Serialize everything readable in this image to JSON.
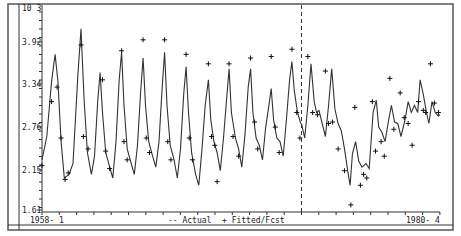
{
  "chart_data": {
    "type": "line",
    "title": "",
    "scale_label": "10 3",
    "xlabel": "",
    "ylabel": "",
    "x_start_label": "1958- 1",
    "x_end_label": "1980- 4",
    "yticks": [
      1.61,
      2.15,
      2.76,
      3.34,
      3.92
    ],
    "ytick_labels": [
      "1.61",
      "2.15",
      "2.76",
      "3.34",
      "3.92"
    ],
    "ylim": [
      1.61,
      4.2
    ],
    "legend": [
      {
        "symbol": "--",
        "label": "Actual"
      },
      {
        "symbol": "+",
        "label": "Fitted/Fcst"
      }
    ],
    "legend_position": "bottom",
    "grid": false,
    "forecast_divider_x_fraction": 0.652,
    "series": [
      {
        "name": "Actual",
        "style": "line",
        "points": [
          [
            0.0,
            2.3
          ],
          [
            0.012,
            2.62
          ],
          [
            0.024,
            3.38
          ],
          [
            0.033,
            3.75
          ],
          [
            0.04,
            3.38
          ],
          [
            0.048,
            2.55
          ],
          [
            0.056,
            2.05
          ],
          [
            0.068,
            2.1
          ],
          [
            0.078,
            2.25
          ],
          [
            0.09,
            3.45
          ],
          [
            0.098,
            4.1
          ],
          [
            0.106,
            3.1
          ],
          [
            0.114,
            2.4
          ],
          [
            0.124,
            2.1
          ],
          [
            0.132,
            2.35
          ],
          [
            0.14,
            3.1
          ],
          [
            0.146,
            3.5
          ],
          [
            0.152,
            2.95
          ],
          [
            0.16,
            2.4
          ],
          [
            0.17,
            2.2
          ],
          [
            0.178,
            2.05
          ],
          [
            0.186,
            2.55
          ],
          [
            0.194,
            3.4
          ],
          [
            0.2,
            3.78
          ],
          [
            0.206,
            3.05
          ],
          [
            0.214,
            2.45
          ],
          [
            0.224,
            2.25
          ],
          [
            0.232,
            2.1
          ],
          [
            0.24,
            2.5
          ],
          [
            0.248,
            3.25
          ],
          [
            0.254,
            3.7
          ],
          [
            0.26,
            3.05
          ],
          [
            0.268,
            2.55
          ],
          [
            0.278,
            2.35
          ],
          [
            0.286,
            2.2
          ],
          [
            0.294,
            2.55
          ],
          [
            0.302,
            3.3
          ],
          [
            0.308,
            3.78
          ],
          [
            0.314,
            3.05
          ],
          [
            0.322,
            2.5
          ],
          [
            0.332,
            2.3
          ],
          [
            0.34,
            2.05
          ],
          [
            0.348,
            2.45
          ],
          [
            0.356,
            3.2
          ],
          [
            0.362,
            3.58
          ],
          [
            0.368,
            2.95
          ],
          [
            0.376,
            2.4
          ],
          [
            0.386,
            2.1
          ],
          [
            0.394,
            1.95
          ],
          [
            0.402,
            2.45
          ],
          [
            0.41,
            3.05
          ],
          [
            0.418,
            3.4
          ],
          [
            0.424,
            2.85
          ],
          [
            0.432,
            2.55
          ],
          [
            0.44,
            2.4
          ],
          [
            0.448,
            2.15
          ],
          [
            0.456,
            2.6
          ],
          [
            0.464,
            3.15
          ],
          [
            0.47,
            3.55
          ],
          [
            0.476,
            2.95
          ],
          [
            0.486,
            2.6
          ],
          [
            0.494,
            2.45
          ],
          [
            0.502,
            2.2
          ],
          [
            0.51,
            2.65
          ],
          [
            0.518,
            3.3
          ],
          [
            0.524,
            3.55
          ],
          [
            0.53,
            2.95
          ],
          [
            0.538,
            2.6
          ],
          [
            0.546,
            2.5
          ],
          [
            0.554,
            2.3
          ],
          [
            0.562,
            2.75
          ],
          [
            0.57,
            3.05
          ],
          [
            0.576,
            3.28
          ],
          [
            0.582,
            2.85
          ],
          [
            0.59,
            2.6
          ],
          [
            0.598,
            2.55
          ],
          [
            0.606,
            2.35
          ],
          [
            0.614,
            2.85
          ],
          [
            0.622,
            3.4
          ],
          [
            0.628,
            3.65
          ],
          [
            0.634,
            3.25
          ],
          [
            0.642,
            2.95
          ],
          [
            0.65,
            2.8
          ],
          [
            0.656,
            2.6
          ],
          [
            0.664,
            2.95
          ],
          [
            0.672,
            3.38
          ],
          [
            0.678,
            3.6
          ],
          [
            0.684,
            3.2
          ],
          [
            0.692,
            2.85
          ],
          [
            0.7,
            2.75
          ],
          [
            0.708,
            2.55
          ],
          [
            0.716,
            2.9
          ],
          [
            0.724,
            3.3
          ],
          [
            0.73,
            3.55
          ],
          [
            0.736,
            3.15
          ],
          [
            0.744,
            2.85
          ],
          [
            0.752,
            2.7
          ],
          [
            0.76,
            2.45
          ],
          [
            0.768,
            2.75
          ],
          [
            0.776,
            3.0
          ],
          [
            0.782,
            3.25
          ],
          [
            0.788,
            2.9
          ],
          [
            0.796,
            2.65
          ],
          [
            0.804,
            2.5
          ],
          [
            0.812,
            2.3
          ],
          [
            0.82,
            2.55
          ],
          [
            0.826,
            2.85
          ],
          [
            0.834,
            2.55
          ],
          [
            0.842,
            2.2
          ],
          [
            0.85,
            2.05
          ],
          [
            0.856,
            1.85
          ],
          [
            0.862,
            2.15
          ],
          [
            0.87,
            2.5
          ],
          [
            0.878,
            2.2
          ],
          [
            0.886,
            2.1
          ],
          [
            0.896,
            2.15
          ],
          [
            0.904,
            2.05
          ]
        ]
      },
      {
        "name": "Fitted/Fcst",
        "style": "plus",
        "points": [
          [
            0.0,
            2.22
          ],
          [
            0.024,
            3.1
          ],
          [
            0.038,
            3.3
          ],
          [
            0.048,
            2.6
          ],
          [
            0.058,
            2.03
          ],
          [
            0.066,
            2.12
          ],
          [
            0.098,
            3.88
          ],
          [
            0.104,
            2.62
          ],
          [
            0.116,
            2.45
          ],
          [
            0.152,
            3.4
          ],
          [
            0.16,
            2.42
          ],
          [
            0.17,
            2.18
          ],
          [
            0.2,
            3.8
          ],
          [
            0.206,
            2.55
          ],
          [
            0.214,
            2.3
          ],
          [
            0.254,
            3.95
          ],
          [
            0.262,
            2.6
          ],
          [
            0.27,
            2.4
          ],
          [
            0.308,
            3.95
          ],
          [
            0.316,
            2.55
          ],
          [
            0.324,
            2.3
          ],
          [
            0.362,
            3.75
          ],
          [
            0.37,
            2.6
          ],
          [
            0.378,
            2.3
          ],
          [
            0.418,
            3.62
          ],
          [
            0.426,
            2.62
          ],
          [
            0.434,
            2.5
          ],
          [
            0.44,
            2.0
          ],
          [
            0.47,
            3.62
          ],
          [
            0.48,
            2.62
          ],
          [
            0.494,
            2.35
          ],
          [
            0.524,
            3.7
          ],
          [
            0.534,
            2.82
          ],
          [
            0.542,
            2.45
          ],
          [
            0.576,
            3.72
          ],
          [
            0.586,
            2.75
          ],
          [
            0.596,
            2.4
          ],
          [
            0.628,
            3.82
          ],
          [
            0.64,
            2.95
          ],
          [
            0.648,
            2.6
          ],
          [
            0.664,
            2.08
          ],
          [
            0.68,
            4.05
          ],
          [
            0.69,
            2.95
          ],
          [
            0.7,
            2.82
          ],
          [
            0.708,
            2.58
          ],
          [
            0.73,
            3.65
          ],
          [
            0.742,
            2.9
          ],
          [
            0.752,
            2.78
          ],
          [
            0.77,
            3.28
          ],
          [
            0.78,
            2.65
          ],
          [
            0.79,
            2.6
          ],
          [
            0.81,
            2.2
          ]
        ]
      }
    ],
    "forecast_series": {
      "actual_points": [
        [
          0.652,
          2.8
        ],
        [
          0.66,
          2.6
        ],
        [
          0.668,
          3.05
        ],
        [
          0.676,
          3.62
        ],
        [
          0.684,
          3.1
        ],
        [
          0.69,
          2.95
        ],
        [
          0.696,
          2.98
        ],
        [
          0.704,
          2.8
        ],
        [
          0.712,
          2.62
        ],
        [
          0.72,
          3.05
        ],
        [
          0.728,
          3.55
        ],
        [
          0.736,
          3.0
        ],
        [
          0.744,
          2.8
        ],
        [
          0.752,
          2.7
        ],
        [
          0.76,
          2.45
        ],
        [
          0.768,
          2.15
        ],
        [
          0.774,
          1.95
        ],
        [
          0.78,
          2.38
        ],
        [
          0.788,
          2.55
        ],
        [
          0.796,
          2.28
        ],
        [
          0.804,
          2.2
        ],
        [
          0.814,
          2.25
        ],
        [
          0.822,
          2.18
        ],
        [
          0.832,
          2.95
        ],
        [
          0.84,
          3.12
        ],
        [
          0.846,
          2.75
        ],
        [
          0.854,
          2.68
        ],
        [
          0.862,
          2.55
        ],
        [
          0.87,
          2.82
        ],
        [
          0.878,
          3.05
        ],
        [
          0.886,
          2.82
        ],
        [
          0.894,
          2.8
        ],
        [
          0.902,
          2.62
        ],
        [
          0.912,
          2.85
        ],
        [
          0.92,
          3.1
        ],
        [
          0.928,
          2.95
        ],
        [
          0.936,
          3.05
        ],
        [
          0.944,
          2.95
        ],
        [
          0.95,
          3.4
        ],
        [
          0.958,
          3.2
        ],
        [
          0.966,
          2.95
        ],
        [
          0.972,
          2.8
        ],
        [
          0.98,
          3.1
        ],
        [
          0.988,
          2.95
        ],
        [
          0.996,
          2.9
        ],
        [
          1.0,
          2.92
        ]
      ],
      "forecast_points": [
        [
          0.668,
          3.72
        ],
        [
          0.68,
          2.95
        ],
        [
          0.692,
          2.92
        ],
        [
          0.712,
          3.52
        ],
        [
          0.72,
          2.8
        ],
        [
          0.73,
          2.82
        ],
        [
          0.744,
          2.45
        ],
        [
          0.76,
          2.15
        ],
        [
          0.776,
          1.68
        ],
        [
          0.786,
          3.02
        ],
        [
          0.8,
          1.95
        ],
        [
          0.808,
          2.1
        ],
        [
          0.816,
          2.05
        ],
        [
          0.83,
          3.1
        ],
        [
          0.838,
          2.42
        ],
        [
          0.852,
          2.55
        ],
        [
          0.86,
          2.35
        ],
        [
          0.874,
          3.42
        ],
        [
          0.884,
          2.72
        ],
        [
          0.9,
          3.22
        ],
        [
          0.91,
          2.88
        ],
        [
          0.92,
          2.8
        ],
        [
          0.93,
          2.5
        ],
        [
          0.946,
          3.1
        ],
        [
          0.958,
          2.98
        ],
        [
          0.964,
          2.95
        ],
        [
          0.976,
          3.62
        ],
        [
          0.986,
          3.08
        ],
        [
          0.996,
          2.95
        ]
      ]
    }
  },
  "labels": {
    "scale": "10 3",
    "x_start": "1958- 1",
    "x_end": "1980- 4",
    "legend_actual": "-- Actual",
    "legend_fitted": "+ Fitted/Fcst",
    "yticks": [
      "3.92",
      "3.34",
      "2.76",
      "2.15",
      "1.61"
    ]
  }
}
